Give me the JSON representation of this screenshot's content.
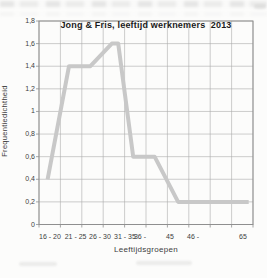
{
  "page": {
    "kind": "scanned-chart-figure",
    "background_color": "#fcfcfb"
  },
  "chart_data": {
    "type": "line",
    "title": "Jong & Fris, leeftijd werknemers  2013",
    "xlabel": "Leeftijdsgroepen",
    "ylabel": "Frequentiedichtheid",
    "xlim": [
      16,
      66
    ],
    "ylim": [
      0,
      1.8
    ],
    "grid": true,
    "legend": "none",
    "colors": {
      "line": "#c8c8c8",
      "gridline": "#ababab",
      "border": "#8f8f8f",
      "tick_text": "#3d3d3d",
      "title_text": "#1a1a1a"
    },
    "series": [
      {
        "name": "frequentiedichtheid werknemers",
        "points": [
          [
            18,
            0.4
          ],
          [
            23,
            1.4
          ],
          [
            28,
            1.4
          ],
          [
            33,
            1.6
          ],
          [
            34.5,
            1.6
          ],
          [
            38,
            0.6
          ],
          [
            43,
            0.6
          ],
          [
            48.5,
            0.2
          ],
          [
            65,
            0.2
          ]
        ]
      }
    ],
    "x_gridline_ages": [
      16,
      21,
      26,
      31,
      36,
      41,
      46,
      51,
      56,
      61,
      66
    ],
    "x_tick_labels": [
      {
        "label": "16 - 20",
        "frac": 0.051
      },
      {
        "label": "21 - 25",
        "frac": 0.171
      },
      {
        "label": "26 - 30",
        "frac": 0.285
      },
      {
        "label": "31 - 35",
        "frac": 0.402
      },
      {
        "label": "36 -",
        "frac": 0.472
      },
      {
        "label": "45",
        "frac": 0.612
      },
      {
        "label": "46 -",
        "frac": 0.72
      },
      {
        "label": "65",
        "frac": 0.953
      }
    ],
    "y_ticks": [
      {
        "value": 0,
        "label": "0"
      },
      {
        "value": 0.2,
        "label": "0,2"
      },
      {
        "value": 0.4,
        "label": "0,4"
      },
      {
        "value": 0.6,
        "label": "0,6"
      },
      {
        "value": 0.8,
        "label": "0,8"
      },
      {
        "value": 1,
        "label": "1"
      },
      {
        "value": 1.2,
        "label": "1,2"
      },
      {
        "value": 1.4,
        "label": "1,4"
      },
      {
        "value": 1.6,
        "label": "1,6"
      },
      {
        "value": 1.8,
        "label": "1,8"
      }
    ]
  }
}
